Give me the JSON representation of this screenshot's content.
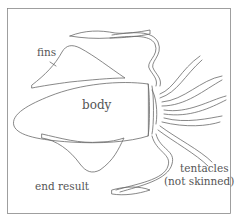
{
  "diagram": {
    "labels": {
      "fins": "fins",
      "body": "body",
      "end_result": "end result",
      "tentacles_line1": "tentacles",
      "tentacles_line2": "(not skinned)"
    }
  }
}
